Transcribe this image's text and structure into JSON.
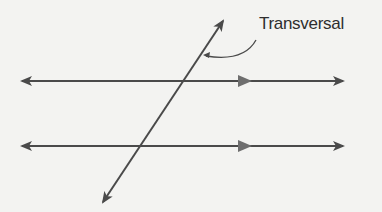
{
  "diagram": {
    "label": "Transversal",
    "colors": {
      "background": "#f3f3f1",
      "line": "#4a4a4a",
      "parallel_marker": "#6e6e6e",
      "text": "#2e2e2e"
    },
    "parallel_lines": [
      {
        "name": "upper-parallel-line",
        "y": 81,
        "x_start": 20,
        "x_end": 345,
        "marker_x": 245
      },
      {
        "name": "lower-parallel-line",
        "y": 146,
        "x_start": 20,
        "x_end": 345,
        "marker_x": 245
      }
    ],
    "transversal": {
      "x1": 102,
      "y1": 204,
      "x2": 224,
      "y2": 19
    },
    "callout": {
      "from": [
        257,
        40
      ],
      "to": [
        205,
        57
      ]
    }
  }
}
